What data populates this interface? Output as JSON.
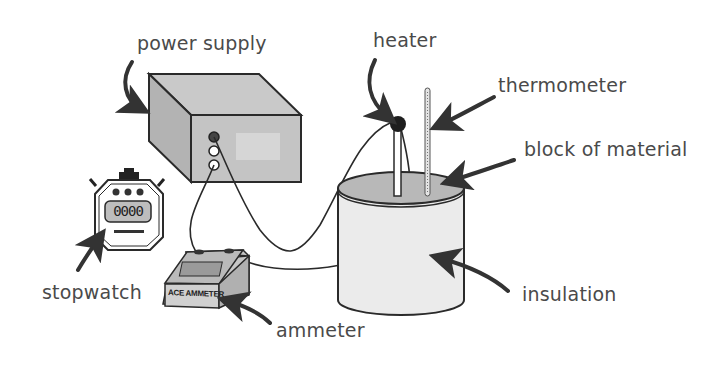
{
  "diagram": {
    "title": "",
    "labels": {
      "power_supply": "power supply",
      "heater": "heater",
      "thermometer": "thermometer",
      "block_of_material": "block of material",
      "stopwatch": "stopwatch",
      "ammeter": "ammeter",
      "insulation": "insulation"
    },
    "device_text": {
      "ammeter_brand": "ACE AMMETER",
      "stopwatch_display": "0000"
    },
    "icons": {
      "power_supply": "box-3d-icon",
      "heater": "immersion-heater-icon",
      "thermometer": "thermometer-icon",
      "block": "cylinder-block-icon",
      "stopwatch": "stopwatch-icon",
      "ammeter": "ammeter-icon"
    },
    "colors": {
      "line": "#2a2a2a",
      "box_top": "#c8c8c8",
      "box_side": "#b4b4b4",
      "box_front": "#c2c2c2",
      "insulation": "#e8e8e8",
      "block_top": "#b9b9b9",
      "label": "#4a4a4a",
      "arrow": "#333333"
    }
  }
}
